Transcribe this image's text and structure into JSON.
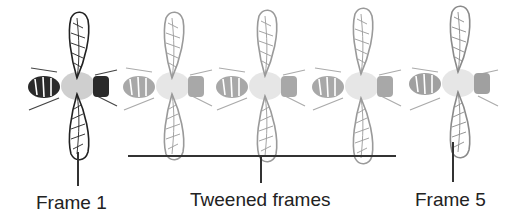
{
  "diagram": {
    "labels": {
      "frame_first": "Frame 1",
      "tweened": "Tweened frames",
      "frame_last": "Frame 5"
    },
    "frames": [
      {
        "index": 1,
        "type": "keyframe",
        "shade": "dark"
      },
      {
        "index": 2,
        "type": "tweened",
        "shade": "light"
      },
      {
        "index": 3,
        "type": "tweened",
        "shade": "light"
      },
      {
        "index": 4,
        "type": "tweened",
        "shade": "light"
      },
      {
        "index": 5,
        "type": "keyframe",
        "shade": "light"
      }
    ],
    "colors": {
      "keyframe_stroke": "#222222",
      "tween_stroke": "#9a9a9a",
      "line": "#333333"
    }
  }
}
